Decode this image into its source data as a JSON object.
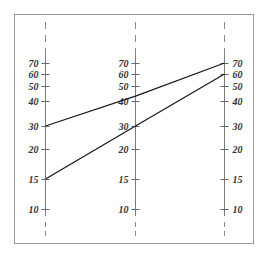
{
  "chart_data": {
    "type": "line",
    "title": "",
    "subtitle": "",
    "xlabel": "",
    "ylabel": "",
    "grid": false,
    "legend": null,
    "scale": "log",
    "axes": [
      {
        "name": "left",
        "ticks": [
          70,
          60,
          50,
          40,
          30,
          20,
          15,
          10
        ],
        "label_side": "left"
      },
      {
        "name": "middle",
        "ticks": [
          70,
          60,
          50,
          40,
          30,
          20,
          15,
          10
        ],
        "label_side": "left"
      },
      {
        "name": "right",
        "ticks": [
          70,
          60,
          50,
          40,
          30,
          20,
          15,
          10
        ],
        "label_side": "right"
      }
    ],
    "x": [
      "left",
      "middle",
      "right"
    ],
    "series": [
      {
        "name": "upper-line",
        "values": [
          30,
          45,
          70
        ]
      },
      {
        "name": "lower-line",
        "values": [
          15,
          30,
          60
        ]
      }
    ],
    "ylim": [
      8,
      80
    ]
  },
  "layout": {
    "frame": {
      "x": 14,
      "y": 14,
      "w": 240,
      "h": 230
    },
    "axis_x": [
      45,
      135,
      224
    ],
    "tick_y": {
      "70": 63,
      "60": 74,
      "50": 86,
      "40": 101,
      "30": 126,
      "20": 149,
      "15": 179,
      "10": 209
    },
    "axis_top": 55,
    "axis_bottom": 216,
    "colors": {
      "line": "#1a1a1a",
      "axis": "#7a7a7a",
      "frame": "#9a9a9a",
      "label": "#333333"
    }
  }
}
